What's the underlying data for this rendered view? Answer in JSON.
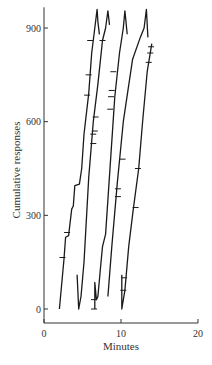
{
  "chart_data": {
    "type": "line",
    "title": "",
    "xlabel": "Minutes",
    "ylabel": "Cumulative responses",
    "xlim": [
      0,
      20
    ],
    "ylim": [
      -40,
      960
    ],
    "xticks": [
      0,
      10,
      20
    ],
    "yticks": [
      0,
      300,
      600,
      900
    ],
    "grid": false,
    "legend": null,
    "series": [
      {
        "name": "record-1",
        "points": [
          [
            2.0,
            0
          ],
          [
            2.6,
            160
          ],
          [
            2.8,
            230
          ],
          [
            3.2,
            235
          ],
          [
            3.6,
            320
          ],
          [
            3.8,
            330
          ],
          [
            4.0,
            395
          ],
          [
            4.6,
            400
          ],
          [
            4.9,
            450
          ],
          [
            5.2,
            560
          ],
          [
            5.8,
            690
          ],
          [
            6.2,
            820
          ],
          [
            6.6,
            900
          ],
          [
            6.9,
            960
          ],
          [
            7.0,
            920
          ],
          [
            7.2,
            880
          ]
        ],
        "ticks": [
          [
            2.4,
            165
          ],
          [
            3.0,
            245
          ],
          [
            5.6,
            685
          ],
          [
            5.8,
            750
          ],
          [
            6.0,
            860
          ]
        ]
      },
      {
        "name": "record-2",
        "points": [
          [
            4.3,
            110
          ],
          [
            4.5,
            0
          ],
          [
            4.8,
            40
          ],
          [
            5.2,
            150
          ],
          [
            5.8,
            420
          ],
          [
            6.4,
            600
          ],
          [
            7.0,
            720
          ],
          [
            7.6,
            860
          ],
          [
            8.0,
            900
          ],
          [
            8.3,
            955
          ],
          [
            8.5,
            910
          ]
        ],
        "ticks": [
          [
            6.4,
            530
          ],
          [
            6.4,
            560
          ],
          [
            6.6,
            570
          ],
          [
            6.7,
            615
          ],
          [
            7.6,
            860
          ]
        ]
      },
      {
        "name": "record-3",
        "points": [
          [
            6.6,
            0
          ],
          [
            6.6,
            85
          ],
          [
            6.8,
            30
          ],
          [
            7.0,
            40
          ],
          [
            7.4,
            150
          ],
          [
            7.6,
            200
          ],
          [
            8.0,
            240
          ],
          [
            8.6,
            460
          ],
          [
            9.2,
            680
          ],
          [
            9.8,
            820
          ],
          [
            10.3,
            900
          ],
          [
            10.5,
            955
          ],
          [
            10.8,
            880
          ]
        ],
        "ticks": [
          [
            6.5,
            0
          ],
          [
            6.5,
            30
          ],
          [
            8.6,
            640
          ],
          [
            8.7,
            680
          ],
          [
            8.8,
            700
          ],
          [
            9.0,
            760
          ]
        ]
      },
      {
        "name": "record-4",
        "points": [
          [
            8.3,
            40
          ],
          [
            8.8,
            200
          ],
          [
            9.5,
            400
          ],
          [
            10.3,
            600
          ],
          [
            11.5,
            800
          ],
          [
            12.5,
            870
          ],
          [
            13.0,
            900
          ],
          [
            13.3,
            960
          ],
          [
            13.5,
            870
          ]
        ],
        "ticks": [
          [
            9.6,
            360
          ],
          [
            9.6,
            385
          ],
          [
            10.2,
            480
          ]
        ]
      },
      {
        "name": "record-5",
        "points": [
          [
            10.1,
            110
          ],
          [
            10.1,
            0
          ],
          [
            10.5,
            60
          ],
          [
            11.0,
            200
          ],
          [
            11.6,
            320
          ],
          [
            12.3,
            450
          ],
          [
            12.8,
            600
          ],
          [
            13.4,
            760
          ],
          [
            14.0,
            850
          ]
        ],
        "ticks": [
          [
            10.3,
            60
          ],
          [
            10.4,
            100
          ],
          [
            11.9,
            325
          ],
          [
            12.2,
            450
          ],
          [
            13.6,
            790
          ],
          [
            13.8,
            820
          ],
          [
            13.9,
            840
          ]
        ]
      }
    ]
  }
}
